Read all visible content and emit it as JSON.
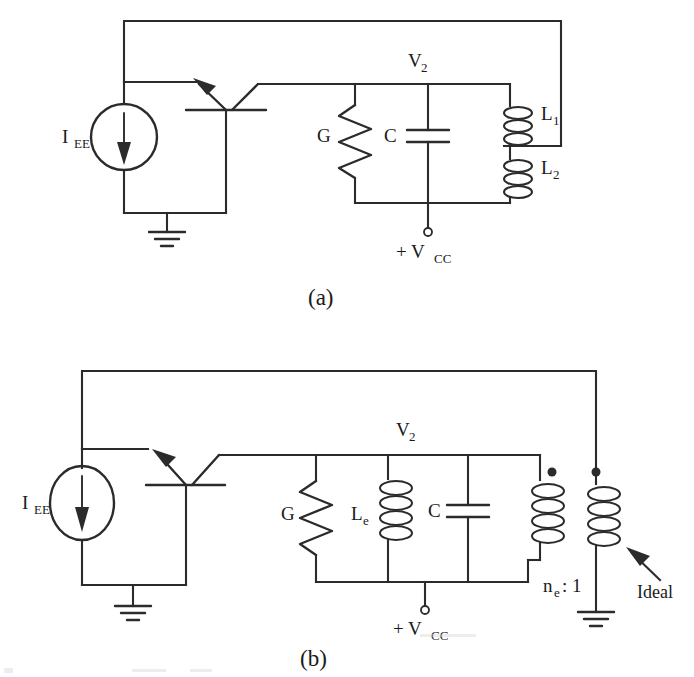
{
  "figure": {
    "type": "schematic-diagram",
    "background_color": "#ffffff",
    "ink_color": "#2b2b2b",
    "panels": [
      {
        "id": "a",
        "caption": "(a)",
        "title": "Colpitts-type oscillator with tapped inductors L1 / L2",
        "labels": {
          "current_source": "I",
          "current_source_sub": "EE",
          "node_voltage": "V",
          "node_voltage_sub": "2",
          "conductance": "G",
          "capacitor": "C",
          "inductor1": "L",
          "inductor1_sub": "1",
          "inductor2": "L",
          "inductor2_sub": "2",
          "supply_plus": "+ V",
          "supply_sub": "CC"
        },
        "components": [
          {
            "name": "current-source",
            "symbol": "ellipse-with-down-arrow",
            "label": "IEE"
          },
          {
            "name": "npn-transistor",
            "symbol": "bjt-npn-rotated",
            "label": ""
          },
          {
            "name": "ground",
            "symbol": "ground-3-bar",
            "label": ""
          },
          {
            "name": "resistor",
            "symbol": "zigzag-vertical",
            "label": "G"
          },
          {
            "name": "capacitor",
            "symbol": "two-plate-vertical",
            "label": "C"
          },
          {
            "name": "inductor-upper",
            "symbol": "coil-3-loop-vertical",
            "label": "L1"
          },
          {
            "name": "inductor-lower",
            "symbol": "coil-3-loop-vertical",
            "label": "L2"
          },
          {
            "name": "supply-terminal",
            "symbol": "open-circle",
            "label": "+ VCC"
          }
        ]
      },
      {
        "id": "b",
        "caption": "(b)",
        "title": "Equivalent circuit using ideal transformer with turns ratio ne : 1",
        "labels": {
          "current_source": "I",
          "current_source_sub": "EE",
          "node_voltage": "V",
          "node_voltage_sub": "2",
          "conductance": "G",
          "inductor_e": "L",
          "inductor_e_sub": "e",
          "capacitor": "C",
          "turns_ratio_n": "n",
          "turns_ratio_n_sub": "e",
          "turns_ratio_rest": ": 1",
          "ideal": "Ideal",
          "supply_plus": "+ V",
          "supply_sub": "CC"
        },
        "components": [
          {
            "name": "current-source",
            "symbol": "ellipse-with-down-arrow",
            "label": "IEE"
          },
          {
            "name": "npn-transistor",
            "symbol": "bjt-npn-rotated",
            "label": ""
          },
          {
            "name": "ground-emitter",
            "symbol": "ground-3-bar",
            "label": ""
          },
          {
            "name": "resistor",
            "symbol": "zigzag-vertical",
            "label": "G"
          },
          {
            "name": "inductor",
            "symbol": "coil-4-loop-vertical",
            "label": "Le"
          },
          {
            "name": "capacitor",
            "symbol": "two-plate-vertical",
            "label": "C"
          },
          {
            "name": "transformer-primary",
            "symbol": "coil-4-loop-vertical-dot",
            "label": ""
          },
          {
            "name": "transformer-secondary",
            "symbol": "coil-4-loop-vertical-dot",
            "label": ""
          },
          {
            "name": "ground-secondary",
            "symbol": "ground-3-bar",
            "label": ""
          },
          {
            "name": "supply-terminal",
            "symbol": "open-circle",
            "label": "+ VCC"
          },
          {
            "name": "ideal-annotation",
            "symbol": "arrow-pointer",
            "label": "Ideal"
          }
        ]
      }
    ]
  }
}
